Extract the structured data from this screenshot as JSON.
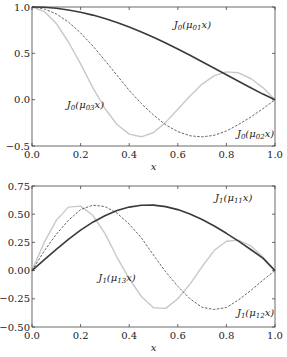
{
  "chart_data": [
    {
      "type": "line",
      "title": "",
      "xlabel": "x",
      "ylabel": "",
      "xlim": [
        0,
        1
      ],
      "ylim": [
        -0.5,
        1.0
      ],
      "xticks": [
        "0.0",
        "0.2",
        "0.4",
        "0.6",
        "0.8",
        "1.0"
      ],
      "yticks": [
        "-0.5",
        "0.0",
        "0.5",
        "1.0"
      ],
      "grid": false,
      "x": [
        0,
        0.05,
        0.1,
        0.15,
        0.2,
        0.25,
        0.3,
        0.35,
        0.4,
        0.45,
        0.5,
        0.55,
        0.6,
        0.65,
        0.7,
        0.75,
        0.8,
        0.85,
        0.9,
        0.95,
        1.0
      ],
      "series": [
        {
          "name": "J0(μ01 x)",
          "style": "solid-dark",
          "label_pos": [
            0.66,
            0.77
          ],
          "values": [
            1,
            0.9964,
            0.9857,
            0.9679,
            0.9434,
            0.9125,
            0.8753,
            0.8323,
            0.7839,
            0.7305,
            0.6727,
            0.6111,
            0.5463,
            0.4789,
            0.4097,
            0.3392,
            0.2683,
            0.1977,
            0.1281,
            0.0601,
            0
          ]
        },
        {
          "name": "J0(μ02 x)",
          "style": "dashed",
          "label_pos": [
            0.92,
            -0.4
          ],
          "values": [
            1,
            0.981,
            0.926,
            0.838,
            0.72,
            0.58,
            0.424,
            0.263,
            0.1,
            -0.044,
            -0.165,
            -0.272,
            -0.345,
            -0.39,
            -0.402,
            -0.385,
            -0.338,
            -0.268,
            -0.188,
            -0.098,
            0
          ]
        },
        {
          "name": "J0(μ03 x)",
          "style": "solid-light",
          "label_pos": [
            0.22,
            -0.09
          ],
          "values": [
            1,
            0.954,
            0.823,
            0.622,
            0.386,
            0.13,
            -0.095,
            -0.268,
            -0.372,
            -0.401,
            -0.354,
            -0.245,
            -0.104,
            0.04,
            0.168,
            0.26,
            0.3,
            0.29,
            0.228,
            0.13,
            0
          ]
        }
      ]
    },
    {
      "type": "line",
      "title": "",
      "xlabel": "x",
      "ylabel": "",
      "xlim": [
        0,
        1
      ],
      "ylim": [
        -0.5,
        0.75
      ],
      "xticks": [
        "0.0",
        "0.2",
        "0.4",
        "0.6",
        "0.8",
        "1.0"
      ],
      "yticks": [
        "-0.50",
        "-0.25",
        "0.00",
        "0.25",
        "0.50",
        "0.75"
      ],
      "grid": false,
      "x": [
        0,
        0.05,
        0.1,
        0.15,
        0.2,
        0.25,
        0.3,
        0.35,
        0.4,
        0.45,
        0.5,
        0.55,
        0.6,
        0.65,
        0.7,
        0.75,
        0.8,
        0.85,
        0.9,
        0.95,
        1.0
      ],
      "series": [
        {
          "name": "J1(μ11 x)",
          "style": "solid-dark",
          "label_pos": [
            0.83,
            0.62
          ],
          "values": [
            0,
            0.095,
            0.188,
            0.277,
            0.358,
            0.429,
            0.487,
            0.533,
            0.563,
            0.579,
            0.581,
            0.567,
            0.541,
            0.502,
            0.453,
            0.395,
            0.331,
            0.261,
            0.187,
            0.111,
            0
          ]
        },
        {
          "name": "J1(μ12 x)",
          "style": "dashed",
          "label_pos": [
            0.92,
            -0.4
          ],
          "values": [
            0,
            0.172,
            0.323,
            0.445,
            0.541,
            0.58,
            0.568,
            0.51,
            0.412,
            0.29,
            0.137,
            -0.011,
            -0.14,
            -0.25,
            -0.325,
            -0.345,
            -0.327,
            -0.26,
            -0.177,
            -0.085,
            0
          ]
        },
        {
          "name": "J1(μ13 x)",
          "style": "solid-light",
          "label_pos": [
            0.35,
            -0.09
          ],
          "values": [
            0,
            0.247,
            0.445,
            0.563,
            0.572,
            0.49,
            0.33,
            0.118,
            -0.071,
            -0.23,
            -0.33,
            -0.335,
            -0.25,
            -0.12,
            0.035,
            0.18,
            0.26,
            0.27,
            0.22,
            0.12,
            0
          ]
        }
      ]
    }
  ],
  "labels": {
    "top": [
      {
        "base": "J",
        "sub": "0",
        "mid": "(μ",
        "sub2": "01",
        "tail": "x)"
      },
      {
        "base": "J",
        "sub": "0",
        "mid": "(μ",
        "sub2": "02",
        "tail": "x)"
      },
      {
        "base": "J",
        "sub": "0",
        "mid": "(μ",
        "sub2": "03",
        "tail": "x)"
      }
    ],
    "bottom": [
      {
        "base": "J",
        "sub": "1",
        "mid": "(μ",
        "sub2": "11",
        "tail": "x)"
      },
      {
        "base": "J",
        "sub": "1",
        "mid": "(μ",
        "sub2": "12",
        "tail": "x)"
      },
      {
        "base": "J",
        "sub": "1",
        "mid": "(μ",
        "sub2": "13",
        "tail": "x)"
      }
    ]
  },
  "colors": {
    "dark": "#3a3a3a",
    "dashed": "#555555",
    "light": "#c8c8c8",
    "axis": "#444444"
  }
}
